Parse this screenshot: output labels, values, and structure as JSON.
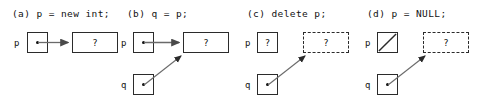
{
  "figure": {
    "background": "#ffffff",
    "stroke": "#2b2b2b",
    "text_color": "#111111",
    "width": 485,
    "height": 102
  },
  "panels": [
    {
      "id": "a",
      "caption": "(a) p = new int;",
      "p_label": "p",
      "q_label": "",
      "p_box_kind": "pointer-dot",
      "p_box_value": "",
      "heap_box_kind": "solid-rect",
      "heap_box_value": "?",
      "arrows": [
        "p-to-heap"
      ]
    },
    {
      "id": "b",
      "caption": "(b) q = p;",
      "p_label": "p",
      "q_label": "q",
      "p_box_kind": "pointer-dot",
      "p_box_value": "",
      "q_box_kind": "pointer-dot",
      "q_box_value": "",
      "heap_box_kind": "solid-rect",
      "heap_box_value": "?",
      "arrows": [
        "p-to-heap",
        "q-to-heap"
      ]
    },
    {
      "id": "c",
      "caption": "(c) delete p;",
      "p_label": "p",
      "q_label": "q",
      "p_box_kind": "unknown-square",
      "p_box_value": "?",
      "q_box_kind": "pointer-dot",
      "q_box_value": "",
      "heap_box_kind": "dashed-rect",
      "heap_box_value": "?",
      "arrows": [
        "q-to-heap"
      ]
    },
    {
      "id": "d",
      "caption": "(d) p = NULL;",
      "p_label": "p",
      "q_label": "q",
      "p_box_kind": "null-slash-square",
      "p_box_value": "",
      "q_box_kind": "pointer-dot",
      "q_box_value": "",
      "heap_box_kind": "dashed-rect",
      "heap_box_value": "?",
      "arrows": [
        "q-to-heap"
      ]
    }
  ]
}
